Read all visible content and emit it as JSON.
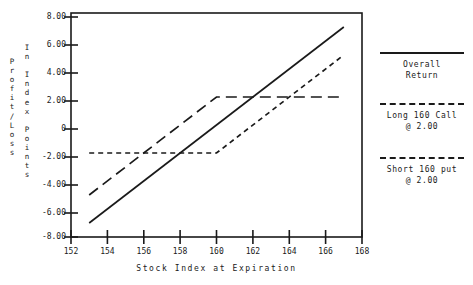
{
  "chart_data": {
    "type": "line",
    "title": "",
    "xlabel": "Stock Index at Expiration",
    "ylabel": "Profit/Loss",
    "ylabel2": "In Index Points",
    "xlim": [
      152,
      168
    ],
    "ylim": [
      -8,
      8
    ],
    "xticks": [
      152,
      154,
      156,
      158,
      160,
      162,
      164,
      166,
      168
    ],
    "xticklabels": [
      "152",
      "154",
      "156",
      "158",
      "160",
      "162",
      "164",
      "166",
      "168"
    ],
    "yticks": [
      8,
      6,
      4,
      2,
      0,
      -2,
      -4,
      -6,
      -8
    ],
    "yticklabels": [
      "8.00",
      "6.00",
      "4.00",
      "2.00",
      "0",
      "-2.00",
      "-4.00",
      "-6.00",
      "-8.00"
    ],
    "grid": false,
    "legend_position": "right",
    "series": [
      {
        "name": "Overall Return",
        "style": "solid",
        "x": [
          153,
          167
        ],
        "values": [
          -7.0,
          7.0
        ]
      },
      {
        "name": "Long 160 Call @ 2.00",
        "style": "short-dash",
        "x": [
          153,
          160,
          167
        ],
        "values": [
          -2.0,
          -2.0,
          5.0
        ]
      },
      {
        "name": "Short 160 put @ 2.00",
        "style": "long-dash",
        "x": [
          153,
          160,
          167
        ],
        "values": [
          -5.0,
          2.0,
          2.0
        ]
      }
    ]
  },
  "axes": {
    "y_title_outer": "Profit/Loss",
    "y_title_inner": "In Index Points",
    "x_title": "Stock Index at Expiration"
  },
  "legend": {
    "entries": [
      {
        "label_line1": "Overall",
        "label_line2": "Return",
        "style": "solid"
      },
      {
        "label_line1": "Long 160 Call",
        "label_line2": "@ 2.00",
        "style": "short-dash"
      },
      {
        "label_line1": "Short 160 put",
        "label_line2": "@ 2.00",
        "style": "long-dash"
      }
    ]
  },
  "colors": {
    "ink": "#1a1a1a",
    "background": "#ffffff"
  }
}
